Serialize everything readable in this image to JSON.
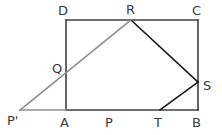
{
  "figure": {
    "canvas": {
      "width": 222,
      "height": 135
    },
    "colors": {
      "background": "#ffffff",
      "outline_stroke": "#3f3f3f",
      "fold_stroke": "#1a1a1a",
      "ray_stroke": "#8e8e8e",
      "label_text": "#3a3a3a"
    },
    "stroke_widths": {
      "outline": 1.6,
      "fold": 1.6,
      "ray": 1.6
    },
    "points": [
      {
        "id": "D",
        "label": "D",
        "x": 66,
        "y": 20,
        "label_x": 58,
        "label_y": 4,
        "interactable": false
      },
      {
        "id": "R",
        "label": "R",
        "x": 131,
        "y": 20,
        "label_x": 126,
        "label_y": 3,
        "interactable": false
      },
      {
        "id": "C",
        "label": "C",
        "x": 198,
        "y": 20,
        "label_x": 192,
        "label_y": 4,
        "interactable": false
      },
      {
        "id": "Q",
        "label": "Q",
        "x": 66,
        "y": 70,
        "label_x": 52,
        "label_y": 62,
        "interactable": false
      },
      {
        "id": "S",
        "label": "S",
        "x": 198,
        "y": 82,
        "label_x": 203,
        "label_y": 79,
        "interactable": false
      },
      {
        "id": "Pprime",
        "label": "P'",
        "x": 20,
        "y": 110,
        "label_x": 7,
        "label_y": 114,
        "interactable": false
      },
      {
        "id": "A",
        "label": "A",
        "x": 66,
        "y": 110,
        "label_x": 60,
        "label_y": 116,
        "interactable": false
      },
      {
        "id": "P",
        "label": "P",
        "x": 110,
        "y": 110,
        "label_x": 105,
        "label_y": 116,
        "interactable": false
      },
      {
        "id": "T",
        "label": "T",
        "x": 160,
        "y": 110,
        "label_x": 154,
        "label_y": 116,
        "interactable": false
      },
      {
        "id": "B",
        "label": "B",
        "x": 198,
        "y": 110,
        "label_x": 192,
        "label_y": 116,
        "interactable": false
      }
    ],
    "segments": [
      {
        "id": "side-DC",
        "from": "D",
        "to": "C",
        "x1": 66,
        "y1": 20,
        "x2": 198,
        "y2": 20,
        "style": "outline"
      },
      {
        "id": "side-AD",
        "from": "A",
        "to": "D",
        "x1": 66,
        "y1": 20,
        "x2": 66,
        "y2": 110,
        "style": "outline"
      },
      {
        "id": "side-BC",
        "from": "B",
        "to": "C",
        "x1": 198,
        "y1": 20,
        "x2": 198,
        "y2": 110,
        "style": "outline"
      },
      {
        "id": "side-AB",
        "from": "A",
        "to": "B",
        "x1": 66,
        "y1": 110,
        "x2": 198,
        "y2": 110,
        "style": "outline"
      },
      {
        "id": "fold-RS",
        "from": "R",
        "to": "S",
        "x1": 131,
        "y1": 20,
        "x2": 198,
        "y2": 82,
        "style": "fold"
      },
      {
        "id": "fold-TS",
        "from": "T",
        "to": "S",
        "x1": 160,
        "y1": 110,
        "x2": 198,
        "y2": 82,
        "style": "fold"
      },
      {
        "id": "ray-PprimeR",
        "from": "Pprime",
        "to": "R",
        "x1": 20,
        "y1": 110,
        "x2": 131,
        "y2": 20,
        "style": "ray"
      },
      {
        "id": "ray-PprimeA",
        "from": "Pprime",
        "to": "A",
        "x1": 20,
        "y1": 110,
        "x2": 66,
        "y2": 110,
        "style": "ray"
      }
    ]
  }
}
